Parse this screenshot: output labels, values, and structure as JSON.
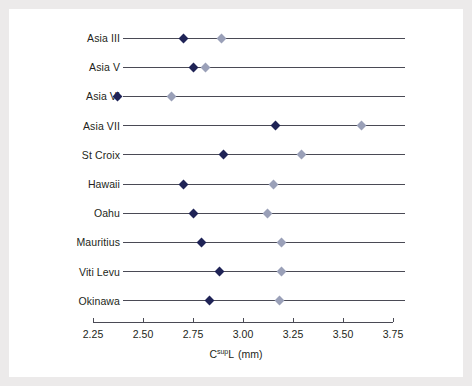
{
  "chart_data": {
    "type": "scatter",
    "title": "",
    "xlabel": "C<sup>sup</sup>L  (mm)",
    "xlabel_parts": {
      "base": "C",
      "sup": "sup",
      "after": "L",
      "unit": "(mm)"
    },
    "ylabel": "",
    "xlim": [
      2.25,
      3.75
    ],
    "xticks": [
      2.25,
      2.5,
      2.75,
      3.0,
      3.25,
      3.5,
      3.75
    ],
    "xticklabels": [
      "2.25",
      "2.50",
      "2.75",
      "3.00",
      "3.25",
      "3.50",
      "3.75"
    ],
    "grid": false,
    "legend": "none",
    "orientation": "horizontal-dotplot",
    "categories": [
      "Asia III",
      "Asia V",
      "Asia VI",
      "Asia VII",
      "St Croix",
      "Hawaii",
      "Oahu",
      "Mauritius",
      "Viti Levu",
      "Okinawa"
    ],
    "series": [
      {
        "name": "dark",
        "marker": "diamond",
        "color": "#1f2356",
        "values": [
          2.7,
          2.75,
          2.37,
          3.16,
          2.9,
          2.7,
          2.75,
          2.79,
          2.88,
          2.83
        ]
      },
      {
        "name": "light",
        "marker": "diamond",
        "color": "#9aa0b8",
        "values": [
          2.89,
          2.81,
          2.64,
          3.59,
          3.29,
          3.15,
          3.12,
          3.19,
          3.19,
          3.18
        ]
      }
    ],
    "colors": {
      "dark_marker": "#1f2356",
      "light_marker": "#9aa0b8",
      "axis": "#4a4a55",
      "text": "#231f20",
      "frame": "#eceaea",
      "background": "#ffffff"
    }
  }
}
